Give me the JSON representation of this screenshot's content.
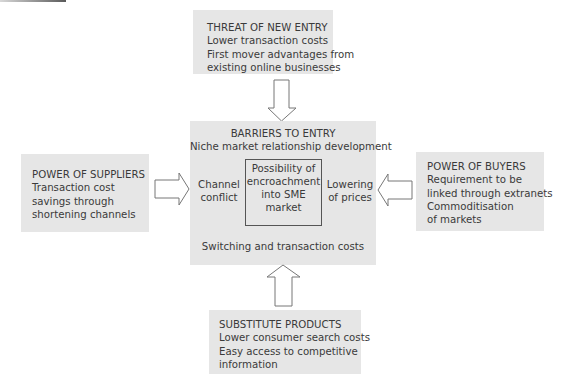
{
  "diagram": {
    "colors": {
      "box_fill": "#e6e6e6",
      "text": "#3a3a3a",
      "arrow_stroke": "#777777",
      "arrow_fill": "#ffffff",
      "inner_border": "#555555"
    },
    "threat_of_new_entry": {
      "heading": "THREAT OF NEW ENTRY",
      "lines": [
        "Lower transaction costs",
        "First mover advantages from",
        "existing online businesses"
      ]
    },
    "power_of_suppliers": {
      "heading": "POWER OF SUPPLIERS",
      "lines": [
        "Transaction cost",
        "savings through",
        "shortening channels"
      ]
    },
    "power_of_buyers": {
      "heading": "POWER OF BUYERS",
      "lines": [
        "Requirement to be",
        "linked through extranets",
        "Commoditisation",
        "of markets"
      ]
    },
    "substitute_products": {
      "heading": "SUBSTITUTE PRODUCTS",
      "lines": [
        "Lower consumer search costs",
        "Easy access to competitive",
        "information"
      ]
    },
    "barriers_to_entry": {
      "heading": "BARRIERS TO ENTRY",
      "subheading": "Niche market relationship development",
      "left_label": [
        "Channel",
        "conflict"
      ],
      "right_label": [
        "Lowering",
        "of prices"
      ],
      "center": [
        "Possibility of",
        "encroachment",
        "into SME",
        "market"
      ],
      "footer": "Switching and transaction costs"
    },
    "arrows": [
      {
        "from": "threat_of_new_entry",
        "to": "barriers_to_entry",
        "direction": "down"
      },
      {
        "from": "power_of_suppliers",
        "to": "barriers_to_entry",
        "direction": "right"
      },
      {
        "from": "power_of_buyers",
        "to": "barriers_to_entry",
        "direction": "left"
      },
      {
        "from": "substitute_products",
        "to": "barriers_to_entry",
        "direction": "up"
      }
    ]
  }
}
